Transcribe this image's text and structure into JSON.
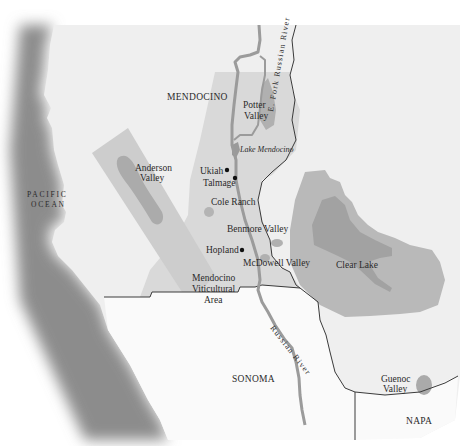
{
  "map": {
    "title": "Mendocino wine regions",
    "colors": {
      "background": "#ffffff",
      "land": "#efefef",
      "mendocino_ava": "#d7d7d7",
      "sub_ava": "#bdbdbd",
      "sub_ava_dark": "#a2a2a2",
      "lake": "#9a9a9a",
      "river": "#9b9b9b",
      "border": "#3a3a3a",
      "coast_shadow": "#8c8c8c"
    },
    "regions": {
      "county_mendocino": "MENDOCINO",
      "county_sonoma": "SONOMA",
      "county_napa": "NAPA",
      "ocean_line1": "PACIFIC",
      "ocean_line2": "OCEAN"
    },
    "appellations": [
      {
        "id": "potter-valley",
        "line1": "Potter",
        "line2": "Valley"
      },
      {
        "id": "anderson-valley",
        "line1": "Anderson",
        "line2": "Valley"
      },
      {
        "id": "cole-ranch",
        "line1": "Cole Ranch"
      },
      {
        "id": "benmore-valley",
        "line1": "Benmore Valley"
      },
      {
        "id": "mcdowell-valley",
        "line1": "McDowell Valley"
      },
      {
        "id": "clear-lake",
        "line1": "Clear Lake"
      },
      {
        "id": "guenoc-valley",
        "line1": "Guenoc",
        "line2": "Valley"
      },
      {
        "id": "mendocino-viticultural-area",
        "line1": "Mendocino",
        "line2": "Viticultural",
        "line3": "Area"
      }
    ],
    "towns": [
      {
        "id": "ukiah",
        "name": "Ukiah"
      },
      {
        "id": "talmage",
        "name": "Talmage"
      },
      {
        "id": "hopland",
        "name": "Hopland"
      }
    ],
    "water": {
      "lake_mendocino": "Lake Mendocino",
      "east_fork": "E. Fork Russian River",
      "russian_river": "Russian River"
    }
  }
}
